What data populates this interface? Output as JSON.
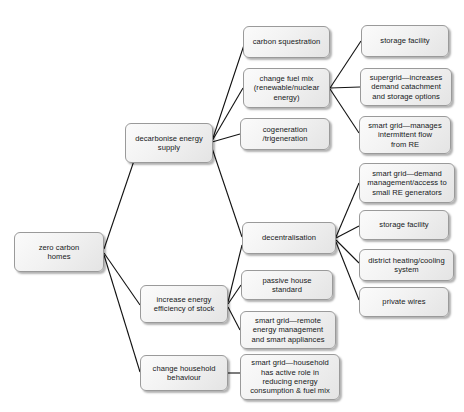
{
  "diagram": {
    "type": "tree-mind-map",
    "background_color": "#ffffff",
    "node_fill_color": "#f0f0f0",
    "node_border_color": "#9a9a9a",
    "edge_color": "#111111",
    "nodes": {
      "root": "zero carbon\nhomes",
      "decarbonise": "decarbonise energy\nsupply",
      "efficiency": "increase energy\nefficiency of stock",
      "behaviour": "change household\nbehaviour",
      "carbon_sequestration": "carbon squestration",
      "change_fuel_mix": "change fuel mix\n(renewable/nuclear\nenergy)",
      "cogeneration": "cogeneration\n/trigeneration",
      "decentralisation": "decentralisation",
      "passive_house": "passive house\nstandard",
      "smart_grid_remote": "smart grid—remote\nenergy management\nand smart appliances",
      "smart_grid_household": "smart grid—household\nhas active role in\nreducing energy\nconsumption & fuel mix",
      "storage_facility_top": "storage facility",
      "supergrid": "supergrid—increases\ndemand catachment\nand storage options",
      "smart_grid_intermittent": "smart grid—manages\nintermittent flow\nfrom RE",
      "smart_grid_demand": "smart grid—demand\nmanagement/access to\nsmall RE generators",
      "storage_facility_mid": "storage facility",
      "district_heating": "district heating/cooling\nsystem",
      "private_wires": "private wires"
    },
    "edges": [
      {
        "from": "root",
        "to": "decarbonise"
      },
      {
        "from": "root",
        "to": "efficiency"
      },
      {
        "from": "root",
        "to": "behaviour"
      },
      {
        "from": "decarbonise",
        "to": "carbon_sequestration"
      },
      {
        "from": "decarbonise",
        "to": "change_fuel_mix"
      },
      {
        "from": "decarbonise",
        "to": "cogeneration"
      },
      {
        "from": "decarbonise",
        "to": "decentralisation"
      },
      {
        "from": "change_fuel_mix",
        "to": "storage_facility_top"
      },
      {
        "from": "change_fuel_mix",
        "to": "supergrid"
      },
      {
        "from": "change_fuel_mix",
        "to": "smart_grid_intermittent"
      },
      {
        "from": "decentralisation",
        "to": "smart_grid_demand"
      },
      {
        "from": "decentralisation",
        "to": "storage_facility_mid"
      },
      {
        "from": "decentralisation",
        "to": "district_heating"
      },
      {
        "from": "decentralisation",
        "to": "private_wires"
      },
      {
        "from": "efficiency",
        "to": "decentralisation"
      },
      {
        "from": "efficiency",
        "to": "passive_house"
      },
      {
        "from": "efficiency",
        "to": "smart_grid_remote"
      },
      {
        "from": "behaviour",
        "to": "smart_grid_household"
      }
    ]
  }
}
